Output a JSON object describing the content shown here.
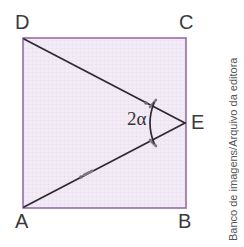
{
  "figure": {
    "type": "geometry-diagram",
    "background_color": "#ffffff",
    "square": {
      "fill_color": "#f1e9f4",
      "stroke_color": "#9a6aa8",
      "grid_color": "#e3d6ea",
      "left": 23,
      "top": 38,
      "right": 186,
      "bottom": 208
    },
    "segment_color": "#2e2b33",
    "vertices": [
      {
        "name": "D",
        "label": "D",
        "x": 23,
        "y": 38
      },
      {
        "name": "C",
        "label": "C",
        "x": 186,
        "y": 38
      },
      {
        "name": "A",
        "label": "A",
        "x": 23,
        "y": 208
      },
      {
        "name": "B",
        "label": "B",
        "x": 186,
        "y": 208
      },
      {
        "name": "E",
        "label": "E",
        "x": 186,
        "y": 123
      }
    ],
    "segments": [
      {
        "name": "DE",
        "from": "D",
        "to": "E",
        "tick_marks": 1
      },
      {
        "name": "AE",
        "from": "A",
        "to": "E",
        "tick_marks": 1
      }
    ],
    "angle": {
      "vertex": "E",
      "label": "2α",
      "arc_color": "#2e2b33"
    }
  },
  "credit": {
    "text": "Banco de imagens/Arquivo da editora"
  }
}
